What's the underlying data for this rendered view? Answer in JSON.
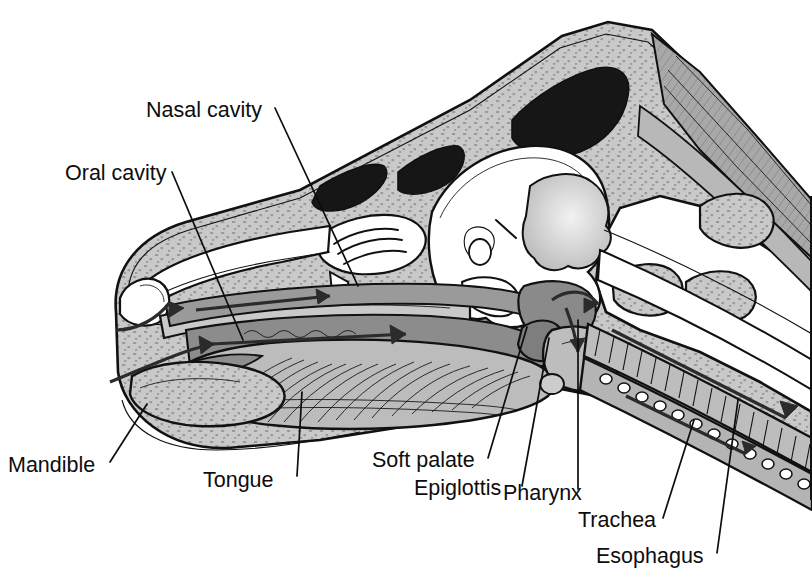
{
  "figure": {
    "frame": {
      "visible": true,
      "color": "#111111"
    }
  },
  "palette": {
    "background": "#ffffff",
    "bone_light": "#c9c9c9",
    "bone_stipple": "#9d9d9d",
    "soft_tissue": "#bfbfbf",
    "mucosa_mid": "#979797",
    "mucosa_dark": "#8a8a8a",
    "muscle_gray": "#a8a8a8",
    "cavity_white": "#ffffff",
    "sinus_black": "#161616",
    "outline": "#111111",
    "arrow": "#2b2b2b",
    "label_text": "#0d0d0d"
  },
  "labels": [
    {
      "id": "nasal-cavity",
      "text": "Nasal cavity",
      "text_x": 146,
      "text_y": 117,
      "anchor": "start",
      "leader": {
        "x1": 275,
        "y1": 108,
        "x2": 358,
        "y2": 286
      }
    },
    {
      "id": "oral-cavity",
      "text": "Oral cavity",
      "text_x": 65,
      "text_y": 180,
      "anchor": "start",
      "leader": {
        "x1": 172,
        "y1": 172,
        "x2": 243,
        "y2": 340
      }
    },
    {
      "id": "mandible",
      "text": "Mandible",
      "text_x": 8,
      "text_y": 472,
      "anchor": "start",
      "leader": {
        "x1": 110,
        "y1": 462,
        "x2": 147,
        "y2": 404
      }
    },
    {
      "id": "tongue",
      "text": "Tongue",
      "text_x": 203,
      "text_y": 487,
      "anchor": "start",
      "leader": {
        "x1": 297,
        "y1": 476,
        "x2": 302,
        "y2": 392
      }
    },
    {
      "id": "soft-palate",
      "text": "Soft palate",
      "text_x": 372,
      "text_y": 467,
      "anchor": "start",
      "leader": {
        "x1": 488,
        "y1": 458,
        "x2": 527,
        "y2": 327
      }
    },
    {
      "id": "epiglottis",
      "text": "Epiglottis",
      "text_x": 414,
      "text_y": 495,
      "anchor": "start",
      "leader": {
        "x1": 522,
        "y1": 486,
        "x2": 549,
        "y2": 338
      }
    },
    {
      "id": "pharynx",
      "text": "Pharynx",
      "text_x": 503,
      "text_y": 500,
      "anchor": "start",
      "leader": {
        "x1": 578,
        "y1": 489,
        "x2": 578,
        "y2": 320
      }
    },
    {
      "id": "trachea",
      "text": "Trachea",
      "text_x": 578,
      "text_y": 527,
      "anchor": "start",
      "leader": {
        "x1": 663,
        "y1": 518,
        "x2": 694,
        "y2": 420
      }
    },
    {
      "id": "esophagus",
      "text": "Esophagus",
      "text_x": 596,
      "text_y": 563,
      "anchor": "start",
      "leader": {
        "x1": 717,
        "y1": 553,
        "x2": 738,
        "y2": 400
      }
    }
  ],
  "structures": [
    {
      "id": "skull-outline",
      "name": "skull and head outline",
      "fill": "bone_light"
    },
    {
      "id": "frontal-sinus",
      "name": "frontal sinus",
      "fill": "sinus_black"
    },
    {
      "id": "nasal-sinus-anterior",
      "name": "anterior nasal sinus",
      "fill": "sinus_black"
    },
    {
      "id": "cranial-cavity",
      "name": "cranial cavity / brain",
      "fill": "cavity_white"
    },
    {
      "id": "cerebellum",
      "name": "cerebellum",
      "fill": "soft_tissue"
    },
    {
      "id": "ethmoid-turbinates",
      "name": "ethmoid turbinates",
      "fill": "cavity_white"
    },
    {
      "id": "dorsal-nasal-meatus",
      "name": "dorsal nasal meatus airway",
      "fill": "mucosa_mid"
    },
    {
      "id": "hard-palate",
      "name": "hard palate",
      "fill": "bone_light"
    },
    {
      "id": "soft-palate-body",
      "name": "soft palate",
      "fill": "mucosa_dark"
    },
    {
      "id": "tongue-body",
      "name": "tongue with muscle striations",
      "fill": "soft_tissue"
    },
    {
      "id": "mandible-body",
      "name": "mandible",
      "fill": "bone_light"
    },
    {
      "id": "epiglottis-body",
      "name": "epiglottis",
      "fill": "mucosa_dark"
    },
    {
      "id": "pharynx-space",
      "name": "pharynx",
      "fill": "mucosa_dark"
    },
    {
      "id": "larynx",
      "name": "larynx",
      "fill": "soft_tissue"
    },
    {
      "id": "trachea-body",
      "name": "trachea with cartilage rings",
      "fill": "soft_tissue"
    },
    {
      "id": "esophagus-body",
      "name": "esophagus with lumen circles",
      "fill": "soft_tissue"
    },
    {
      "id": "cervical-vertebrae",
      "name": "cervical vertebrae",
      "fill": "bone_light"
    },
    {
      "id": "neck-muscles",
      "name": "dorsal neck musculature",
      "fill": "muscle_gray"
    }
  ],
  "flow_arrows": [
    {
      "id": "arrow-nostril-in",
      "name": "air entering nostril",
      "path": "nostril to nasal meatus"
    },
    {
      "id": "arrow-nasal-caudal",
      "name": "air moving caudally through nasal cavity"
    },
    {
      "id": "arrow-oral-caudal",
      "name": "air/bolus moving caudally through oral cavity"
    },
    {
      "id": "arrow-pharynx-down",
      "name": "flow through pharynx toward larynx"
    },
    {
      "id": "arrow-trachea",
      "name": "air descending the trachea"
    },
    {
      "id": "arrow-esophagus",
      "name": "bolus descending the esophagus"
    }
  ]
}
